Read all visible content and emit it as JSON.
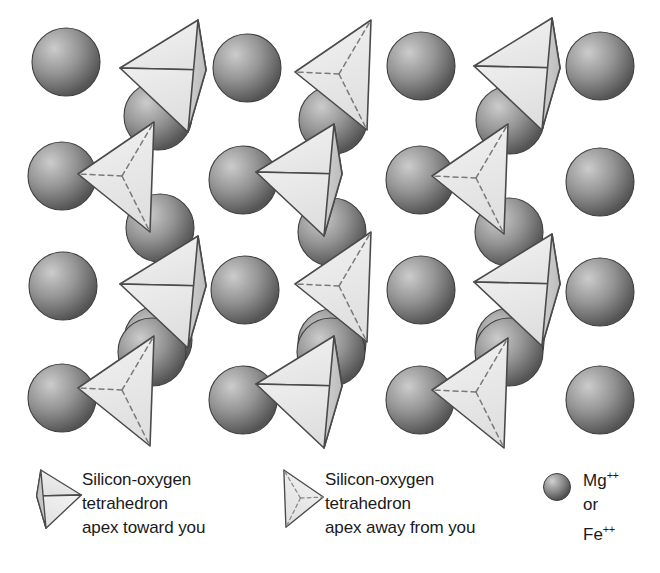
{
  "figure": {
    "background_color": "#ffffff"
  },
  "palette": {
    "sphere_highlight": "#c4c4c4",
    "sphere_mid": "#8d8d8d",
    "sphere_edge": "#4e4e4e",
    "sphere_outline": "#3f3f3f",
    "tetra_face_light": "#ededed",
    "tetra_face_mid": "#e2e2e2",
    "tetra_face_shaded": "#c6c6c6",
    "tetra_outline": "#4a4a4a",
    "dash_color": "#6e6e6e",
    "text_color": "#1a1a1a"
  },
  "lattice": {
    "label": "silicon-oxygen tetrahedra and metal cation lattice",
    "sphere_radius": 34,
    "tetra_scale": 1.0,
    "spheres": [
      {
        "cx": 66,
        "cy": 62,
        "r": 34,
        "name": "cation-sphere"
      },
      {
        "cx": 247,
        "cy": 68,
        "r": 34,
        "name": "cation-sphere"
      },
      {
        "cx": 158,
        "cy": 116,
        "r": 34,
        "name": "cation-sphere"
      },
      {
        "cx": 421,
        "cy": 66,
        "r": 34,
        "name": "cation-sphere"
      },
      {
        "cx": 333,
        "cy": 120,
        "r": 34,
        "name": "cation-sphere"
      },
      {
        "cx": 600,
        "cy": 66,
        "r": 34,
        "name": "cation-sphere"
      },
      {
        "cx": 510,
        "cy": 120,
        "r": 34,
        "name": "cation-sphere"
      },
      {
        "cx": 62,
        "cy": 176,
        "r": 34,
        "name": "cation-sphere"
      },
      {
        "cx": 160,
        "cy": 228,
        "r": 34,
        "name": "cation-sphere"
      },
      {
        "cx": 243,
        "cy": 180,
        "r": 34,
        "name": "cation-sphere"
      },
      {
        "cx": 332,
        "cy": 232,
        "r": 34,
        "name": "cation-sphere"
      },
      {
        "cx": 420,
        "cy": 180,
        "r": 34,
        "name": "cation-sphere"
      },
      {
        "cx": 509,
        "cy": 232,
        "r": 34,
        "name": "cation-sphere"
      },
      {
        "cx": 600,
        "cy": 182,
        "r": 34,
        "name": "cation-sphere"
      },
      {
        "cx": 63,
        "cy": 286,
        "r": 34,
        "name": "cation-sphere"
      },
      {
        "cx": 158,
        "cy": 340,
        "r": 34,
        "name": "cation-sphere"
      },
      {
        "cx": 245,
        "cy": 290,
        "r": 34,
        "name": "cation-sphere"
      },
      {
        "cx": 332,
        "cy": 343,
        "r": 34,
        "name": "cation-sphere"
      },
      {
        "cx": 421,
        "cy": 290,
        "r": 34,
        "name": "cation-sphere"
      },
      {
        "cx": 510,
        "cy": 342,
        "r": 34,
        "name": "cation-sphere"
      },
      {
        "cx": 600,
        "cy": 292,
        "r": 34,
        "name": "cation-sphere"
      },
      {
        "cx": 62,
        "cy": 398,
        "r": 34,
        "name": "cation-sphere"
      },
      {
        "cx": 152,
        "cy": 352,
        "r": 34,
        "name": "cation-sphere"
      },
      {
        "cx": 243,
        "cy": 400,
        "r": 34,
        "name": "cation-sphere"
      },
      {
        "cx": 331,
        "cy": 352,
        "r": 34,
        "name": "cation-sphere"
      },
      {
        "cx": 420,
        "cy": 400,
        "r": 34,
        "name": "cation-sphere"
      },
      {
        "cx": 509,
        "cy": 352,
        "r": 34,
        "name": "cation-sphere"
      },
      {
        "cx": 600,
        "cy": 400,
        "r": 34,
        "name": "cation-sphere"
      }
    ],
    "tetrahedra": [
      {
        "x": 120,
        "y": 20,
        "type": "toward",
        "name": "tetrahedron-apex-toward"
      },
      {
        "x": 295,
        "y": 20,
        "type": "away",
        "name": "tetrahedron-apex-away"
      },
      {
        "x": 474,
        "y": 18,
        "type": "toward",
        "name": "tetrahedron-apex-toward"
      },
      {
        "x": 78,
        "y": 122,
        "type": "away",
        "name": "tetrahedron-apex-away"
      },
      {
        "x": 256,
        "y": 124,
        "type": "toward",
        "name": "tetrahedron-apex-toward"
      },
      {
        "x": 432,
        "y": 124,
        "type": "away",
        "name": "tetrahedron-apex-away"
      },
      {
        "x": 120,
        "y": 236,
        "type": "toward",
        "name": "tetrahedron-apex-toward"
      },
      {
        "x": 295,
        "y": 232,
        "type": "away",
        "name": "tetrahedron-apex-away"
      },
      {
        "x": 474,
        "y": 234,
        "type": "toward",
        "name": "tetrahedron-apex-toward"
      },
      {
        "x": 78,
        "y": 336,
        "type": "away",
        "name": "tetrahedron-apex-away"
      },
      {
        "x": 256,
        "y": 336,
        "type": "toward",
        "name": "tetrahedron-apex-toward"
      },
      {
        "x": 432,
        "y": 338,
        "type": "away",
        "name": "tetrahedron-apex-away"
      }
    ]
  },
  "legend": {
    "items": [
      {
        "key": "toward",
        "icon": "tetrahedron-apex-toward-icon",
        "lines": [
          "Silicon-oxygen",
          "tetrahedron",
          "apex toward you"
        ]
      },
      {
        "key": "away",
        "icon": "tetrahedron-apex-away-icon",
        "lines": [
          "Silicon-oxygen",
          "tetrahedron",
          "apex away from you"
        ]
      }
    ],
    "ion": {
      "icon": "cation-sphere-icon",
      "lines": [
        {
          "base": "Mg",
          "sup": "++"
        },
        {
          "base": "or",
          "sup": ""
        },
        {
          "base": "Fe",
          "sup": "++"
        }
      ]
    }
  }
}
